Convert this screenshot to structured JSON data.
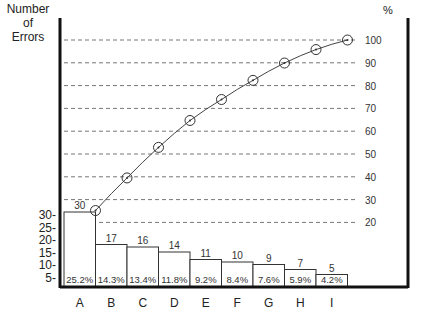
{
  "chart_data": {
    "type": "bar",
    "title": "",
    "ylabel": "Number of Errors",
    "ylabel_lines": [
      "Number",
      "of",
      "Errors"
    ],
    "y2label": "%",
    "xlabel": "",
    "categories": [
      "A",
      "B",
      "C",
      "D",
      "E",
      "F",
      "G",
      "H",
      "I"
    ],
    "series": [
      {
        "name": "Number of Errors",
        "type": "bar",
        "values": [
          30,
          17,
          16,
          14,
          11,
          10,
          9,
          7,
          5
        ]
      },
      {
        "name": "Percentage",
        "type": "label",
        "values": [
          "25.2%",
          "14.3%",
          "13.4%",
          "11.8%",
          "9.2%",
          "8.4%",
          "7.6%",
          "5.9%",
          "4.2%"
        ]
      },
      {
        "name": "Cumulative %",
        "type": "line",
        "values": [
          25.2,
          39.5,
          52.9,
          64.7,
          73.9,
          82.3,
          89.9,
          95.8,
          100
        ]
      }
    ],
    "left_ticks": [
      "30-",
      "25-",
      "20-",
      "15-",
      "10-",
      "5-"
    ],
    "right_ticks": [
      "100",
      "90",
      "80",
      "70",
      "60",
      "50",
      "40",
      "30",
      "20"
    ],
    "y2lim": [
      20,
      100
    ],
    "grid": "dashed horizontal at right-axis ticks",
    "legend": "none"
  }
}
